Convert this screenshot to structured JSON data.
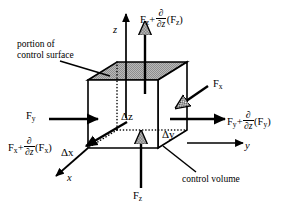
{
  "figure": {
    "type": "diagram",
    "background_color": "#ffffff",
    "line_color": "#000000",
    "shaded_face_color": "#a8a8a8"
  },
  "axes": {
    "z_label": "z",
    "y_label": "y",
    "x_label": "x"
  },
  "forces": {
    "top": {
      "base": "F",
      "base_sub": "z",
      "operator": "+",
      "deriv_num": "∂",
      "deriv_den": "∂z",
      "arg_open": "(F",
      "arg_sub": "z",
      "arg_close": ")"
    },
    "bottom": {
      "base": "F",
      "base_sub": "z"
    },
    "left": {
      "base": "F",
      "base_sub": "y"
    },
    "right": {
      "base": "F",
      "base_sub": "y",
      "operator": "+",
      "deriv_num": "∂",
      "deriv_den": "∂z",
      "arg_open": "(F",
      "arg_sub": "y",
      "arg_close": ")"
    },
    "upper_right": {
      "base": "F",
      "base_sub": "x"
    },
    "lower_left": {
      "base": "F",
      "base_sub": "x",
      "operator": "+",
      "deriv_num": "∂",
      "deriv_den": "∂z",
      "arg_open": "(F",
      "arg_sub": "x",
      "arg_close": ")"
    }
  },
  "dimensions": {
    "delta_z": "Δz",
    "delta_y": "Δy",
    "delta_x": "Δx"
  },
  "annotations": {
    "control_surface_line1": "portion of",
    "control_surface_line2": "control surface",
    "control_volume": "control volume"
  }
}
